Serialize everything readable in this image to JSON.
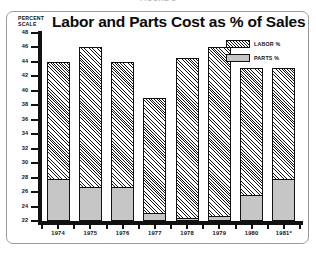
{
  "figure_caption": "FIGURE 3",
  "title": "Labor and Parts Cost as % of Sales",
  "scale_label": {
    "line1": "PERCENT",
    "line2": "SCALE"
  },
  "legend": {
    "position": "top-right",
    "items": [
      {
        "label": "LABOR %",
        "swatch": "hatch",
        "color": "#141414"
      },
      {
        "label": "PARTS %",
        "swatch": "solid",
        "color": "#c6c6c6"
      }
    ]
  },
  "colors": {
    "axis": "#111111",
    "parts_fill": "#c6c6c6",
    "labor_hatch": "#141414",
    "background": "#ffffff",
    "frame_border": "#9a9a9a"
  },
  "chart_data": {
    "type": "bar",
    "title": "Labor and Parts Cost as % of Sales",
    "xlabel": "",
    "ylabel": "PERCENT SCALE",
    "ylim": [
      22,
      48
    ],
    "ytick_step": 2,
    "yticks": [
      48,
      46,
      44,
      42,
      40,
      38,
      36,
      34,
      32,
      30,
      28,
      26,
      24,
      22
    ],
    "ytick_labels": [
      "48",
      "46",
      "44",
      "42",
      "40",
      "38",
      "36",
      "34",
      "32",
      "30",
      "28",
      "26",
      "24",
      "22"
    ],
    "grid": false,
    "stacked": true,
    "baseline": 22,
    "categories": [
      "1974",
      "1975",
      "1976",
      "1977",
      "1978",
      "1979",
      "1980",
      "1981*"
    ],
    "series": [
      {
        "name": "PARTS %",
        "values": [
          28.0,
          26.8,
          26.8,
          23.3,
          22.6,
          22.8,
          25.8,
          28.0
        ]
      },
      {
        "name": "LABOR %",
        "values": [
          44.0,
          46.1,
          44.0,
          39.0,
          44.5,
          46.1,
          43.2,
          43.2
        ]
      }
    ],
    "note": "Stacked bars: gray PARTS segment spans baseline 22 to the PARTS value; hatched LABOR segment spans the PARTS value to the LABOR (total) value."
  }
}
